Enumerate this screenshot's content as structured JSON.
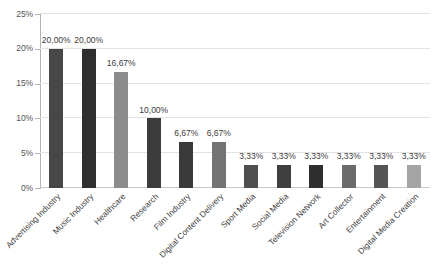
{
  "chart_data": {
    "type": "bar",
    "title": "",
    "subtitle": "",
    "xlabel": "",
    "ylabel": "",
    "ylim": [
      0,
      25
    ],
    "grid": true,
    "legend": "none",
    "decimal_separator": ",",
    "value_suffix": "%",
    "categories": [
      "Advertising Industry",
      "Music Industry",
      "Healthcare",
      "Research",
      "Film Industry",
      "Digital Content Delivery",
      "Sport Media",
      "Social Media",
      "Television Network",
      "Art Collector",
      "Entertainment",
      "Digital Media Creation"
    ],
    "values": [
      20.0,
      20.0,
      16.67,
      10.0,
      6.67,
      6.67,
      3.33,
      3.33,
      3.33,
      3.33,
      3.33,
      3.33
    ],
    "value_labels": [
      "20,00%",
      "20,00%",
      "16,67%",
      "10,00%",
      "6,67%",
      "6,67%",
      "3,33%",
      "3,33%",
      "3,33%",
      "3,33%",
      "3,33%",
      "3,33%"
    ],
    "bar_colors": [
      "#474747",
      "#2f2f2f",
      "#8c8c8c",
      "#3c3c3c",
      "#3a3a3a",
      "#737373",
      "#4f4f4f",
      "#3f3f3f",
      "#2e2e2e",
      "#6b6b6b",
      "#555555",
      "#a5a5a5"
    ],
    "y_ticks": [
      0,
      5,
      10,
      15,
      20,
      25
    ],
    "y_tick_labels": [
      "0%",
      "5%",
      "10%",
      "15%",
      "20%",
      "25%"
    ],
    "colors": {
      "background": "#ffffff",
      "gridline": "#e2e2e2",
      "axis": "#b4b4b4",
      "tick_text": "#545454",
      "label_text": "#3f3f3f"
    }
  }
}
